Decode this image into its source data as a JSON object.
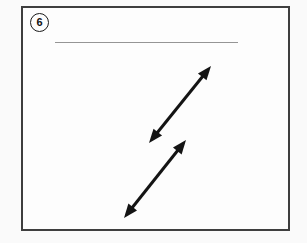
{
  "figure": {
    "label": "6",
    "canvas": {
      "width": 307,
      "height": 243,
      "background": "#fafafa"
    },
    "panel": {
      "border_color": "#3e3e3e",
      "fill": "#fdfdfd"
    },
    "blank_line": {
      "x1": 55,
      "x2": 238,
      "y": 42.5,
      "color": "#959595",
      "stroke_width": 1.2
    },
    "arrows": {
      "color": "#141414",
      "stroke_width": 3,
      "head_length": 14,
      "head_half_width": 5.5,
      "items": [
        {
          "name": "upper-double-arrow",
          "x1": 149,
          "y1": 143,
          "x2": 211,
          "y2": 66
        },
        {
          "name": "lower-double-arrow",
          "x1": 124,
          "y1": 218,
          "x2": 186,
          "y2": 140
        }
      ]
    }
  }
}
